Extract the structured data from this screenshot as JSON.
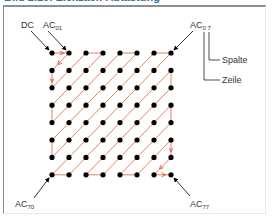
{
  "title": "Bild 2.10: Zickzack-Abtastung",
  "labels": {
    "dc": "DC",
    "ac01": {
      "base": "AC",
      "sub": "01"
    },
    "ac07": {
      "base": "AC",
      "sub": "0 7"
    },
    "ac70": {
      "base": "AC",
      "sub": "70"
    },
    "ac77": {
      "base": "AC",
      "sub": "77"
    },
    "spalte": "Spalte",
    "zeile": "Zeile"
  },
  "grid": {
    "rows": 8,
    "cols": 8,
    "x0": 52,
    "y0": 53,
    "dx": 17,
    "dy": 17.4
  },
  "colors": {
    "dot": "#000000",
    "path": "#e06040",
    "frame": "#8a8f96",
    "text": "#333333"
  }
}
